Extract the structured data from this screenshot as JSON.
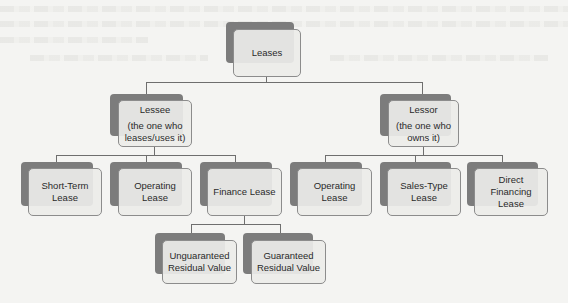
{
  "diagram": {
    "type": "hierarchy",
    "root": {
      "label": "Leases",
      "children": [
        {
          "label": "Lessee",
          "sublabel_1": "(the one who",
          "sublabel_2": "leases/uses it)",
          "children": [
            {
              "label_1": "Short-Term",
              "label_2": "Lease"
            },
            {
              "label_1": "Operating Lease",
              "label_2": ""
            },
            {
              "label_1": "Finance Lease",
              "label_2": "",
              "children": [
                {
                  "label_1": "Unguaranteed",
                  "label_2": "Residual Value"
                },
                {
                  "label_1": "Guaranteed",
                  "label_2": "Residual Value"
                }
              ]
            }
          ]
        },
        {
          "label": "Lessor",
          "sublabel_1": "(the one who",
          "sublabel_2": "owns it)",
          "children": [
            {
              "label_1": "Operating Lease",
              "label_2": ""
            },
            {
              "label_1": "Sales-Type",
              "label_2": "Lease"
            },
            {
              "label_1": "Direct Financing",
              "label_2": "Lease"
            }
          ]
        }
      ]
    }
  },
  "colors": {
    "background": "#f4f4f2",
    "box_shadow": "#7c7c7c",
    "box_face": "#ebebe9",
    "box_border": "#8c8c8c",
    "connector": "#6e6e6e",
    "text": "#2a2a2a"
  }
}
